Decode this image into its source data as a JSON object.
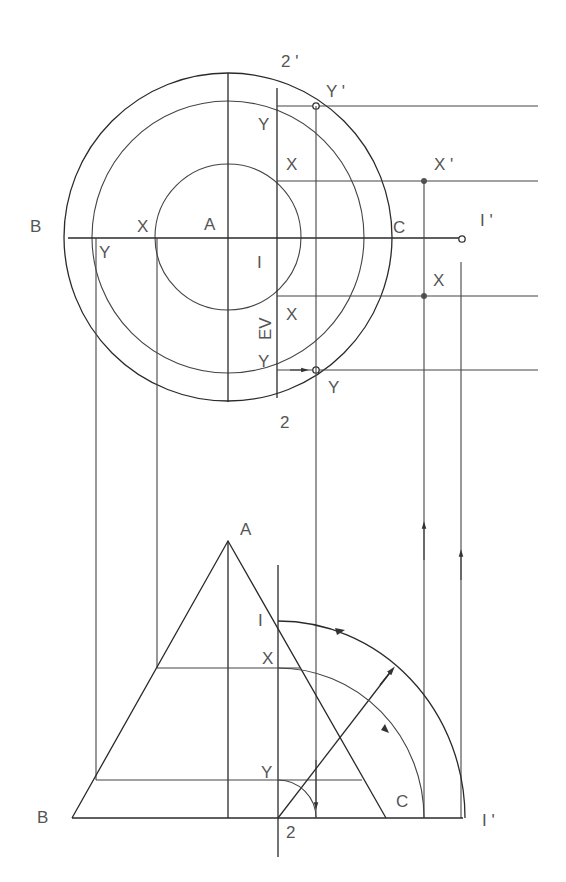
{
  "diagram": {
    "type": "descriptive-geometry cone section (plan and elevation)",
    "top_view": {
      "labels": {
        "b": "B",
        "a": "A",
        "c": "C",
        "one": "I",
        "one_prime": "I '",
        "two": "2",
        "two_prime": "2 '",
        "ev": "EV",
        "x_left": "X",
        "y_left": "Y",
        "y_upper": "Y",
        "x_upper": "X",
        "x_lower": "X",
        "y_lower": "Y",
        "y_prime": "Y '",
        "x_prime": "X '",
        "x_right": "X",
        "y_right": "Y"
      }
    },
    "front_view": {
      "labels": {
        "a": "A",
        "b": "B",
        "c": "C",
        "one": "I",
        "one_prime": "I '",
        "two": "2",
        "x": "X",
        "y": "Y"
      }
    },
    "colors": {
      "line": "#2a2a2a",
      "label": "#555555"
    }
  }
}
